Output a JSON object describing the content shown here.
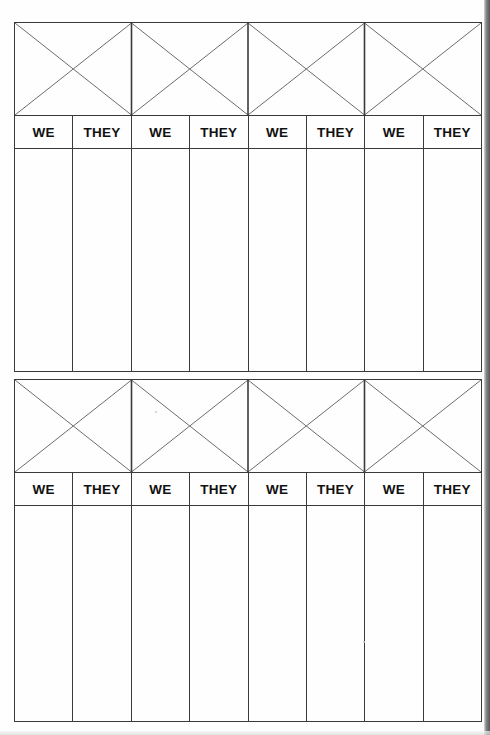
{
  "document": {
    "title": "WE / THEY Score Sheet",
    "type": "printable-tally-worksheet",
    "background_color": "#fefefe",
    "ink_color": "#3a3a3a",
    "text_color": "#111111"
  },
  "blocks": [
    {
      "id": "block-0",
      "x_zone": {
        "label": "x-pattern-banner",
        "cells": 4,
        "stroke_color": "#6b6b6b"
      },
      "header": {
        "labels": [
          "WE",
          "THEY",
          "WE",
          "THEY",
          "WE",
          "THEY",
          "WE",
          "THEY"
        ]
      },
      "body": {
        "columns": 8,
        "rows": 0,
        "values": [
          "",
          "",
          "",
          "",
          "",
          "",
          "",
          ""
        ]
      }
    },
    {
      "id": "block-1",
      "x_zone": {
        "label": "x-pattern-banner",
        "cells": 4,
        "stroke_color": "#6b6b6b"
      },
      "header": {
        "labels": [
          "WE",
          "THEY",
          "WE",
          "THEY",
          "WE",
          "THEY",
          "WE",
          "THEY"
        ]
      },
      "body": {
        "columns": 8,
        "rows": 0,
        "values": [
          "",
          "",
          "",
          "",
          "",
          "",
          "",
          ""
        ]
      }
    }
  ]
}
